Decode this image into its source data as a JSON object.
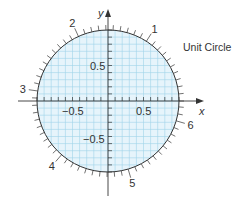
{
  "title": "Unit Circle",
  "axes": {
    "x_label": "x",
    "y_label": "y",
    "x_tick_labels": [
      {
        "value": -0.5,
        "text": "−0.5"
      },
      {
        "value": 0.5,
        "text": "0.5"
      }
    ],
    "y_tick_labels": [
      {
        "value": 0.5,
        "text": "0.5"
      },
      {
        "value": -0.5,
        "text": "−0.5"
      }
    ]
  },
  "circle": {
    "radius": 1,
    "fill": "#e6f4fb",
    "grid_color": "#9fd3ea",
    "stroke": "#333333",
    "grid_step": 0.1,
    "arc_tick_step_radians": 0.1
  },
  "radian_markers": [
    {
      "angle": 1,
      "text": "1"
    },
    {
      "angle": 2,
      "text": "2"
    },
    {
      "angle": 3,
      "text": "3"
    },
    {
      "angle": 4,
      "text": "4"
    },
    {
      "angle": 5,
      "text": "5"
    },
    {
      "angle": 6,
      "text": "6"
    }
  ],
  "chart_data": {
    "type": "diagram",
    "title": "Unit Circle",
    "xlabel": "x",
    "ylabel": "y",
    "xlim": [
      -1.3,
      1.3
    ],
    "ylim": [
      -1.3,
      1.3
    ],
    "grid": true,
    "grid_step": 0.1,
    "circle": {
      "center": [
        0,
        0
      ],
      "radius": 1
    },
    "x_ticks_labeled": [
      -0.5,
      0.5
    ],
    "y_ticks_labeled": [
      -0.5,
      0.5
    ],
    "arc_ticks_every_radians": 0.1,
    "arc_labels_radians": [
      1,
      2,
      3,
      4,
      5,
      6
    ]
  }
}
